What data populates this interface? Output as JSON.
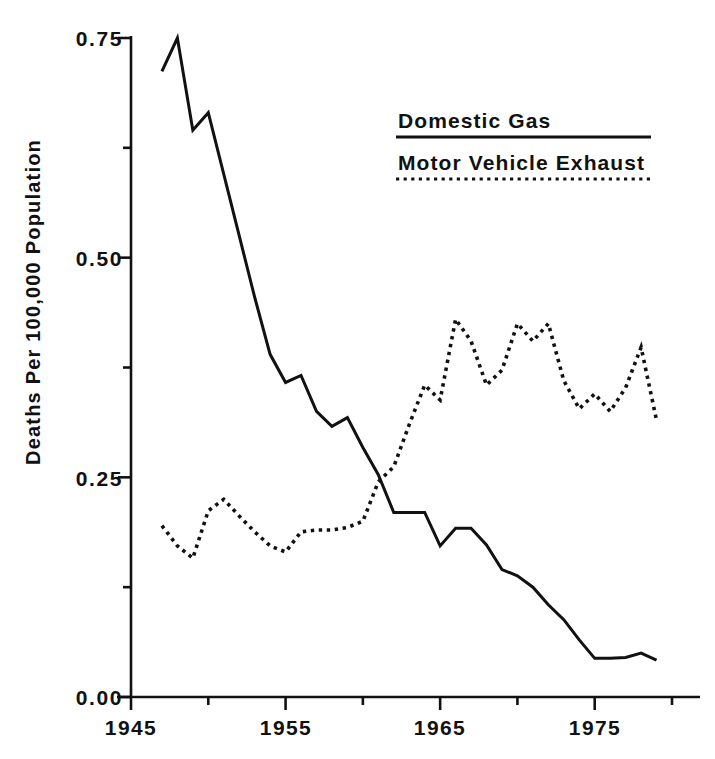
{
  "chart_data": {
    "type": "line",
    "title": "",
    "subtitle": "",
    "xlabel": "",
    "ylabel": "Deaths Per 100,000 Population",
    "xlim": [
      1945,
      1980
    ],
    "ylim": [
      0.0,
      0.75
    ],
    "grid": false,
    "legend_position": "upper-right",
    "y_ticks_major": [
      "0.00",
      "0.25",
      "0.50",
      "0.75"
    ],
    "y_tick_values_major": [
      0.0,
      0.25,
      0.5,
      0.75
    ],
    "y_tick_values_minor": [
      0.125,
      0.375,
      0.625
    ],
    "x_ticks_major": [
      "1945",
      "1955",
      "1965",
      "1975"
    ],
    "x_tick_values_major": [
      1945,
      1955,
      1965,
      1975
    ],
    "x_tick_values_minor": [
      1950,
      1960,
      1970,
      1980
    ],
    "series": [
      {
        "name": "Domestic Gas",
        "style": "solid",
        "color": "#111111",
        "x": [
          1947,
          1948,
          1949,
          1950,
          1951,
          1952,
          1953,
          1954,
          1955,
          1956,
          1957,
          1958,
          1959,
          1960,
          1961,
          1962,
          1963,
          1964,
          1965,
          1966,
          1967,
          1968,
          1969,
          1970,
          1971,
          1972,
          1973,
          1974,
          1975,
          1976,
          1977,
          1978,
          1979
        ],
        "values": [
          0.712,
          0.75,
          0.645,
          0.665,
          0.595,
          0.525,
          0.455,
          0.39,
          0.358,
          0.366,
          0.325,
          0.308,
          0.318,
          0.284,
          0.253,
          0.21,
          0.21,
          0.21,
          0.172,
          0.192,
          0.192,
          0.173,
          0.145,
          0.138,
          0.125,
          0.105,
          0.088,
          0.065,
          0.044,
          0.044,
          0.045,
          0.05,
          0.042
        ]
      },
      {
        "name": "Motor Vehicle Exhaust",
        "style": "dotted",
        "color": "#111111",
        "x": [
          1947,
          1948,
          1949,
          1950,
          1951,
          1952,
          1953,
          1954,
          1955,
          1956,
          1957,
          1958,
          1959,
          1960,
          1961,
          1962,
          1963,
          1964,
          1965,
          1966,
          1967,
          1968,
          1969,
          1970,
          1971,
          1972,
          1973,
          1974,
          1975,
          1976,
          1977,
          1978,
          1979
        ],
        "values": [
          0.195,
          0.172,
          0.158,
          0.212,
          0.225,
          0.206,
          0.188,
          0.172,
          0.165,
          0.188,
          0.19,
          0.19,
          0.193,
          0.2,
          0.245,
          0.262,
          0.31,
          0.355,
          0.338,
          0.43,
          0.405,
          0.355,
          0.372,
          0.425,
          0.405,
          0.425,
          0.36,
          0.328,
          0.345,
          0.325,
          0.352,
          0.398,
          0.315
        ]
      }
    ],
    "annotations": []
  },
  "legend": {
    "entries": [
      {
        "label": "Domestic Gas",
        "style": "solid"
      },
      {
        "label": "Motor Vehicle Exhaust",
        "style": "dotted"
      }
    ]
  },
  "colors": {
    "ink": "#111111",
    "background": "#ffffff"
  }
}
